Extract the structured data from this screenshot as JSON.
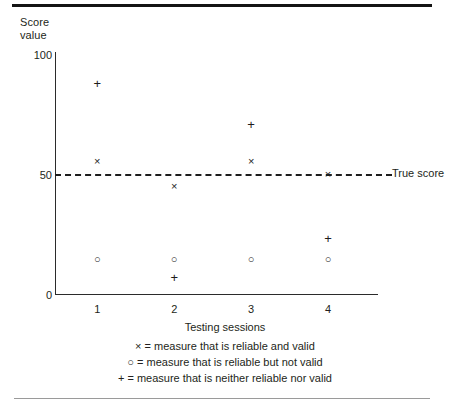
{
  "figure": {
    "background": "#ffffff",
    "ink_color": "#231f20",
    "top_rule_color": "#141414",
    "bottom_rule_color": "#9a9a9a"
  },
  "chart_data": {
    "type": "scatter",
    "title": "",
    "ylabel": "Score\nvalue",
    "xlabel": "Testing sessions",
    "xlim": [
      0.45,
      4.65
    ],
    "ylim": [
      0,
      100
    ],
    "grid": false,
    "categories": [
      "1",
      "2",
      "3",
      "4"
    ],
    "x": [
      1,
      2,
      3,
      4
    ],
    "xticklabels": [
      "1",
      "2",
      "3",
      "4"
    ],
    "yticks": [
      0,
      50,
      100
    ],
    "yticklabels": [
      "0",
      "50",
      "100"
    ],
    "legend_position": "below-axes",
    "series": [
      {
        "name": "measure that is reliable and valid",
        "marker": "x",
        "marker_glyph": "×",
        "values": [
          55,
          45,
          55,
          50
        ],
        "color": "#1d1d1d"
      },
      {
        "name": "measure that is reliable but not valid",
        "marker": "o",
        "marker_glyph": "○",
        "values": [
          15,
          15,
          15,
          15
        ],
        "color": "#1d1d1d"
      },
      {
        "name": "measure that is neither reliable nor valid",
        "marker": "+",
        "marker_glyph": "+",
        "values": [
          87,
          7,
          70,
          23
        ],
        "color": "#1d1d1d"
      }
    ],
    "reference_line": {
      "label": "True score",
      "value": 50,
      "style": "dashed",
      "color": "#1d1d1d"
    },
    "annotations": []
  },
  "legend": {
    "rows": [
      {
        "symbol": "×",
        "equals": "=",
        "text": "measure that is reliable and valid"
      },
      {
        "symbol": "○",
        "equals": "=",
        "text": "measure that is reliable but not valid"
      },
      {
        "symbol": "+",
        "equals": "=",
        "text": "measure that is neither reliable nor valid"
      }
    ],
    "line_1": "× = measure that is reliable and valid",
    "line_2": "○ = measure that is reliable but not valid",
    "line_3": "+ = measure that is neither reliable nor valid"
  }
}
